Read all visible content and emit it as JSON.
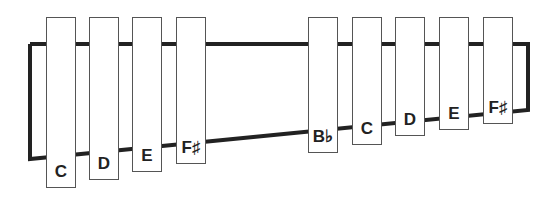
{
  "diagram": {
    "title": "",
    "frame": {
      "color": "#222222",
      "stroke_width": 4
    },
    "bars": [
      {
        "label": "C",
        "x": 46,
        "w": 30,
        "bottom": 188
      },
      {
        "label": "D",
        "x": 89,
        "w": 30,
        "bottom": 180
      },
      {
        "label": "E",
        "x": 132,
        "w": 30,
        "bottom": 172
      },
      {
        "label": "F♯",
        "x": 176,
        "w": 30,
        "bottom": 164
      },
      {
        "label": "B♭",
        "x": 308,
        "w": 30,
        "bottom": 153
      },
      {
        "label": "C",
        "x": 352,
        "w": 30,
        "bottom": 145
      },
      {
        "label": "D",
        "x": 395,
        "w": 30,
        "bottom": 136
      },
      {
        "label": "E",
        "x": 439,
        "w": 30,
        "bottom": 130
      },
      {
        "label": "F♯",
        "x": 483,
        "w": 30,
        "bottom": 124
      }
    ]
  }
}
